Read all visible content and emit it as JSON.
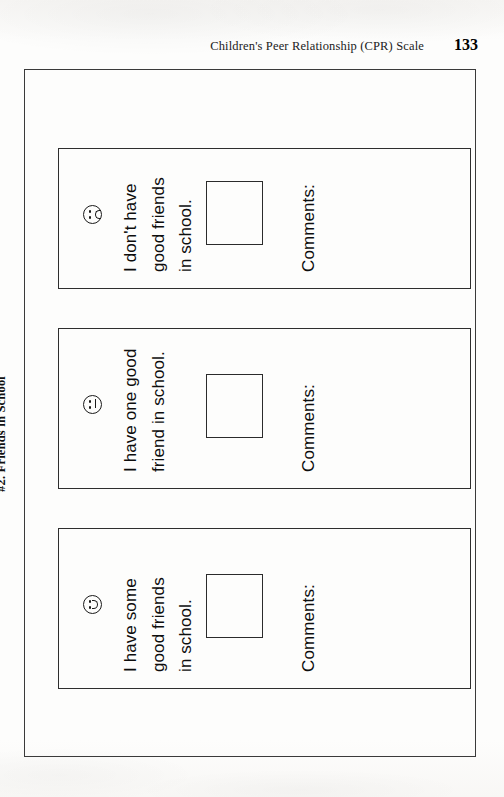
{
  "running_head": {
    "title": "Children's Peer Relationship (CPR) Scale",
    "page_number": "133"
  },
  "section": {
    "title": "#2.  Friends in School"
  },
  "items": [
    {
      "face": "happy-face-icon",
      "lines": [
        "I have some",
        "good friends",
        "in school."
      ],
      "comments_label": "Comments:",
      "checkbox_value": ""
    },
    {
      "face": "neutral-face-icon",
      "lines": [
        "I have one good",
        "friend in school."
      ],
      "comments_label": "Comments:",
      "checkbox_value": ""
    },
    {
      "face": "sad-face-icon",
      "lines": [
        "I don't have",
        "good friends",
        "in school."
      ],
      "comments_label": "Comments:",
      "checkbox_value": ""
    }
  ],
  "colors": {
    "ink": "#0d0d0d",
    "rule": "#2e2e2e",
    "paper": "#fdfdfc"
  }
}
